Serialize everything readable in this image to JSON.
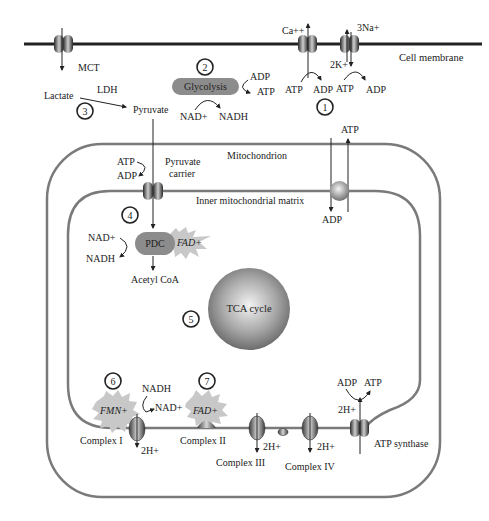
{
  "diagram": {
    "colors": {
      "membrane": "#222222",
      "mito_membrane": "#7a7a7a",
      "glycolysis_fill": "#8c8c8c",
      "pdc_fill": "#8c8c8c",
      "cofactor_star": "#c8c8c8",
      "tca_sphere": "#9a9a9a",
      "text": "#222222"
    },
    "cell_membrane": {
      "label": "Cell membrane",
      "transporters": [
        {
          "name": "MCT",
          "label": "MCT"
        },
        {
          "name": "Ca-pump",
          "ion": "Ca++"
        },
        {
          "name": "Na-K-pump",
          "ion_out": "3Na+",
          "ion_in": "2K+"
        }
      ]
    },
    "atp_consumers": {
      "ca_pump": {
        "atp": "ATP",
        "adp": "ADP"
      },
      "na_k_pump": {
        "atp": "ATP",
        "adp": "ADP"
      },
      "marker": "1"
    },
    "glycolysis": {
      "label": "Glycolysis",
      "marker": "2",
      "adp": "ADP",
      "atp": "ATP",
      "nad": "NAD+",
      "nadh": "NADH"
    },
    "lactate": {
      "lactate": "Lactate",
      "enzyme": "LDH",
      "pyruvate": "Pyruvate",
      "marker": "3"
    },
    "mitochondrion": {
      "label": "Mitochondrion",
      "inner_label": "Inner mitochondrial matrix",
      "pyruvate_carrier": {
        "label_line1": "Pyruvate",
        "label_line2": "carrier",
        "atp": "ATP",
        "adp": "ADP"
      },
      "ant": {
        "atp": "ATP",
        "adp": "ADP"
      }
    },
    "pdc": {
      "label": "PDC",
      "cofactor": "FAD+",
      "marker": "4",
      "nad": "NAD+",
      "nadh": "NADH",
      "product": "Acetyl CoA"
    },
    "tca": {
      "label": "TCA cycle",
      "marker": "5"
    },
    "etc": {
      "complex1": {
        "label": "Complex I",
        "cofactor": "FMN+",
        "marker": "6",
        "nadh": "NADH",
        "nad": "NAD+",
        "protons": "2H+"
      },
      "complex2": {
        "label": "Complex II",
        "cofactor": "FAD+",
        "marker": "7"
      },
      "complex3": {
        "label": "Complex III",
        "protons": "2H+"
      },
      "complex4": {
        "label": "Complex IV",
        "protons": "2H+"
      },
      "atp_synthase": {
        "label": "ATP synthase",
        "protons": "2H+",
        "adp": "ADP",
        "atp": "ATP"
      }
    }
  }
}
